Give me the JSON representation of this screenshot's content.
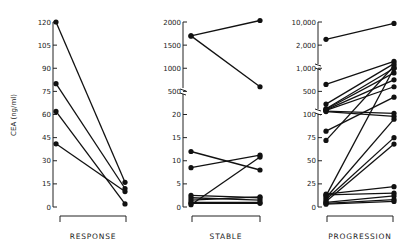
{
  "chart_data": [
    {
      "type": "line",
      "panel": "RESPONSE",
      "ylabel": "CEA (ng/ml)",
      "yticks": [
        "0",
        "15",
        "30",
        "45",
        "60",
        "75",
        "90",
        "105",
        "120"
      ],
      "ylim": [
        0,
        120
      ],
      "x": [
        "before",
        "after"
      ],
      "series": [
        {
          "values": [
            120,
            16
          ]
        },
        {
          "values": [
            80,
            12
          ]
        },
        {
          "values": [
            62,
            2
          ]
        },
        {
          "values": [
            41,
            10
          ]
        }
      ]
    },
    {
      "type": "line",
      "panel": "STABLE",
      "yticks": [
        "0",
        "5",
        "10",
        "15",
        "20",
        "500",
        "1000",
        "1500",
        "2000"
      ],
      "axis_break": "between 20 and 500",
      "x": [
        "before",
        "after"
      ],
      "series": [
        {
          "values": [
            1700,
            2100
          ]
        },
        {
          "values": [
            1700,
            600
          ]
        },
        {
          "values": [
            12,
            8
          ]
        },
        {
          "values": [
            8.5,
            11.2
          ]
        },
        {
          "values": [
            0.5,
            10.8
          ]
        },
        {
          "values": [
            2.5,
            2
          ]
        },
        {
          "values": [
            2,
            1.5
          ]
        },
        {
          "values": [
            1.5,
            2.2
          ]
        },
        {
          "values": [
            1,
            1
          ]
        },
        {
          "values": [
            0.8,
            0.8
          ]
        }
      ]
    },
    {
      "type": "line",
      "panel": "PROGRESSION",
      "yticks": [
        "0",
        "25",
        "50",
        "75",
        "100",
        "500",
        "1,000",
        "2,000",
        "10,000"
      ],
      "axis_breaks": [
        "between 100 and 500",
        "between 1,000 and 2,000"
      ],
      "x": [
        "before",
        "after"
      ],
      "series": [
        {
          "values": [
            4000,
            9500
          ]
        },
        {
          "values": [
            650,
            1300
          ]
        },
        {
          "values": [
            280,
            1200
          ]
        },
        {
          "values": [
            200,
            1000
          ]
        },
        {
          "values": [
            190,
            900
          ]
        },
        {
          "values": [
            180,
            750
          ]
        },
        {
          "values": [
            170,
            600
          ]
        },
        {
          "values": [
            160,
            120
          ]
        },
        {
          "values": [
            150,
            98
          ]
        },
        {
          "values": [
            82,
            400
          ]
        },
        {
          "values": [
            72,
            1100
          ]
        },
        {
          "values": [
            12,
            1000
          ]
        },
        {
          "values": [
            10,
            95
          ]
        },
        {
          "values": [
            8,
            75
          ]
        },
        {
          "values": [
            6,
            68
          ]
        },
        {
          "values": [
            14,
            22
          ]
        },
        {
          "values": [
            13,
            15
          ]
        },
        {
          "values": [
            5,
            12
          ]
        },
        {
          "values": [
            4,
            8
          ]
        },
        {
          "values": [
            3,
            6
          ]
        }
      ]
    }
  ],
  "labels": {
    "ylabel": "CEA (ng/ml)",
    "panel1": "RESPONSE",
    "panel2": "STABLE",
    "panel3": "PROGRESSION",
    "p1_ticks": [
      "120",
      "105",
      "90",
      "75",
      "60",
      "45",
      "30",
      "15",
      "0"
    ],
    "p2_ticks": [
      "2000",
      "1500",
      "1000",
      "500",
      "20",
      "15",
      "10",
      "5",
      "0"
    ],
    "p3_ticks": [
      "10,000",
      "2,000",
      "1,000",
      "500",
      "100",
      "75",
      "50",
      "25",
      "0"
    ]
  }
}
